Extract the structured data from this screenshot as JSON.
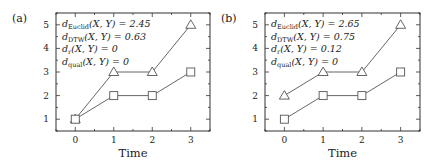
{
  "chart_data": [
    {
      "type": "line",
      "panel_label": "(a)",
      "xlabel": "Time",
      "ylabel": "",
      "x": [
        0,
        1,
        2,
        3
      ],
      "xlim": [
        -0.5,
        3.5
      ],
      "ylim": [
        0.5,
        5.5
      ],
      "xticks": [
        "0",
        "1",
        "2",
        "3"
      ],
      "yticks": [
        "1",
        "2",
        "3",
        "4",
        "5"
      ],
      "series": [
        {
          "name": "X (triangles)",
          "marker": "triangle",
          "values": [
            1,
            3,
            3,
            5
          ]
        },
        {
          "name": "Y (squares)",
          "marker": "square",
          "values": [
            1,
            2,
            2,
            3
          ]
        }
      ],
      "annotations": [
        {
          "d": "d",
          "sub": "Euclid",
          "args": "(X, Y) = 2.45"
        },
        {
          "d": "d",
          "sub": "DTW",
          "args": "(X, Y) = 0.63"
        },
        {
          "d": "d",
          "sub": "r",
          "args": "(X, Y) = 0"
        },
        {
          "d": "d",
          "sub": "qual",
          "args": "(X, Y) = 0"
        }
      ]
    },
    {
      "type": "line",
      "panel_label": "(b)",
      "xlabel": "Time",
      "ylabel": "",
      "x": [
        0,
        1,
        2,
        3
      ],
      "xlim": [
        -0.5,
        3.5
      ],
      "ylim": [
        0.5,
        5.5
      ],
      "xticks": [
        "0",
        "1",
        "2",
        "3"
      ],
      "yticks": [
        "1",
        "2",
        "3",
        "4",
        "5"
      ],
      "series": [
        {
          "name": "X (triangles)",
          "marker": "triangle",
          "values": [
            2,
            3,
            3,
            5
          ]
        },
        {
          "name": "Y (squares)",
          "marker": "square",
          "values": [
            1,
            2,
            2,
            3
          ]
        }
      ],
      "annotations": [
        {
          "d": "d",
          "sub": "Euclid",
          "args": "(X, Y) = 2.65"
        },
        {
          "d": "d",
          "sub": "DTW",
          "args": "(X, Y) = 0.75"
        },
        {
          "d": "d",
          "sub": "r",
          "args": "(X, Y) = 0.12"
        },
        {
          "d": "d",
          "sub": "qual",
          "args": "(X, Y) = 0"
        }
      ]
    }
  ],
  "style": {
    "line_color": "#555555",
    "axis_color": "#333333",
    "marker_fill": "#ffffff"
  }
}
